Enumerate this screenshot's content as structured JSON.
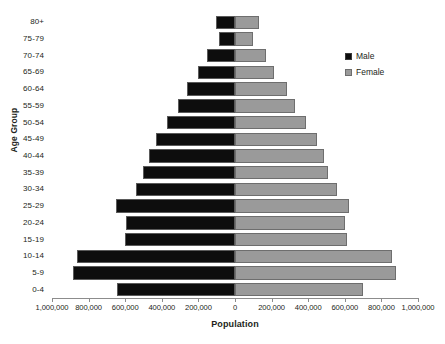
{
  "chart_data": {
    "type": "bar",
    "subtype": "population-pyramid",
    "title": "",
    "xlabel": "Population",
    "ylabel": "Age Group",
    "grid": false,
    "legend_position": "right",
    "xlim": [
      -1000000,
      1000000
    ],
    "xtick_values": [
      -1000000,
      -800000,
      -600000,
      -400000,
      -200000,
      0,
      200000,
      400000,
      600000,
      800000,
      1000000
    ],
    "xtick_labels": [
      "1,000,000",
      "800,000",
      "600,000",
      "400,000",
      "200,000",
      "0",
      "200,000",
      "400,000",
      "600,000",
      "800,000",
      "1,000,000"
    ],
    "categories": [
      "0-4",
      "5-9",
      "10-14",
      "15-19",
      "20-24",
      "25-29",
      "30-34",
      "35-39",
      "40-44",
      "45-49",
      "50-54",
      "55-59",
      "60-64",
      "65-69",
      "70-74",
      "75-79",
      "80+"
    ],
    "series": [
      {
        "name": "Male",
        "color": "#0d0d0d",
        "values": [
          645000,
          885000,
          865000,
          600000,
          595000,
          650000,
          540000,
          505000,
          470000,
          430000,
          370000,
          310000,
          265000,
          200000,
          155000,
          90000,
          105000
        ]
      },
      {
        "name": "Female",
        "color": "#9a9a9a",
        "values": [
          700000,
          880000,
          860000,
          610000,
          600000,
          625000,
          560000,
          510000,
          485000,
          450000,
          390000,
          330000,
          285000,
          215000,
          170000,
          100000,
          130000
        ]
      }
    ]
  },
  "legend": {
    "items": [
      {
        "label": "Male",
        "swatch": "male-swatch"
      },
      {
        "label": "Female",
        "swatch": "female-swatch"
      }
    ]
  },
  "axes": {
    "x_title": "Population",
    "y_title": "Age Group"
  }
}
